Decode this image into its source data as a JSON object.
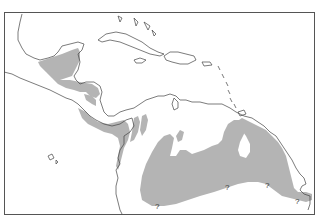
{
  "map": {
    "region": "Central America, Caribbean and northern South America",
    "range_fill_color": "#b4b4b4",
    "coastline_color": "#444444",
    "frame_color": "#555555",
    "background_color": "#ffffff",
    "uncertainty_markers": [
      {
        "label": "?",
        "x": 155,
        "y": 203
      },
      {
        "label": "?",
        "x": 225,
        "y": 184
      },
      {
        "label": "?",
        "x": 265,
        "y": 182
      },
      {
        "label": "?",
        "x": 295,
        "y": 198
      }
    ]
  }
}
